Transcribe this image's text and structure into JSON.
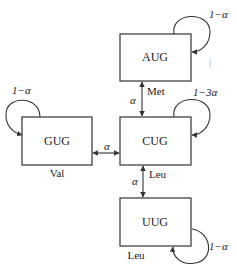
{
  "diagram": {
    "nodes": [
      {
        "id": "AUG",
        "label": "AUG",
        "amino_acid": "Met",
        "self_loop": "1−α"
      },
      {
        "id": "GUG",
        "label": "GUG",
        "amino_acid": "Val",
        "self_loop": "1−α"
      },
      {
        "id": "CUG",
        "label": "CUG",
        "amino_acid": "Leu",
        "self_loop": "1−3α"
      },
      {
        "id": "UUG",
        "label": "UUG",
        "amino_acid": "Leu",
        "self_loop": "1−α"
      }
    ],
    "edges": [
      {
        "from": "AUG",
        "to": "CUG",
        "label": "α",
        "bidirectional": true
      },
      {
        "from": "GUG",
        "to": "CUG",
        "label": "α",
        "bidirectional": true
      },
      {
        "from": "CUG",
        "to": "UUG",
        "label": "α",
        "bidirectional": true
      }
    ],
    "marks": {
      "tick": "|"
    }
  }
}
